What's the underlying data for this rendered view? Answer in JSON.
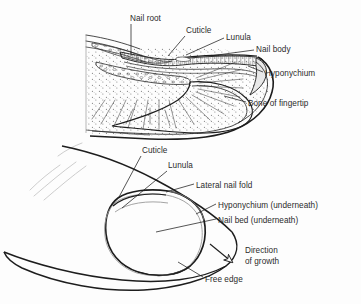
{
  "figure": {
    "kind": "anatomical-diagram",
    "background_color": "#fdfdfd",
    "ink_color": "#1d1d1d",
    "text_color": "#2b2b2b",
    "light_ink_color": "#b9b9b9"
  },
  "cross_section": {
    "name": "sagittal-section-of-fingertip",
    "labels": [
      {
        "id": "nail-root",
        "text": "Nail root",
        "x": 130,
        "y": 14
      },
      {
        "id": "cuticle",
        "text": "Cuticle",
        "x": 186,
        "y": 26
      },
      {
        "id": "lunula",
        "text": "Lunula",
        "x": 226,
        "y": 33
      },
      {
        "id": "nail-body",
        "text": "Nail body",
        "x": 256,
        "y": 45
      },
      {
        "id": "hyponychium",
        "text": "Hyponychium",
        "x": 265,
        "y": 69
      },
      {
        "id": "bone-of-fingertip",
        "text": "Bone of fingertip",
        "x": 248,
        "y": 99
      }
    ]
  },
  "surface_view": {
    "name": "dorsal-view-of-fingertip",
    "labels": [
      {
        "id": "cuticle-2",
        "text": "Cuticle",
        "x": 142,
        "y": 146
      },
      {
        "id": "lunula-2",
        "text": "Lunula",
        "x": 168,
        "y": 161
      },
      {
        "id": "lateral-nail-fold",
        "text": "Lateral nail fold",
        "x": 196,
        "y": 181
      },
      {
        "id": "hyponychium-2",
        "text": "Hyponychium (underneath)",
        "x": 218,
        "y": 201
      },
      {
        "id": "nail-bed",
        "text": "Nail bed (underneath)",
        "x": 218,
        "y": 216
      },
      {
        "id": "direction-line-1",
        "text": "Direction",
        "x": 245,
        "y": 246
      },
      {
        "id": "direction-line-2",
        "text": "of growth",
        "x": 245,
        "y": 257
      },
      {
        "id": "free-edge",
        "text": "Free edge",
        "x": 205,
        "y": 275
      }
    ]
  }
}
